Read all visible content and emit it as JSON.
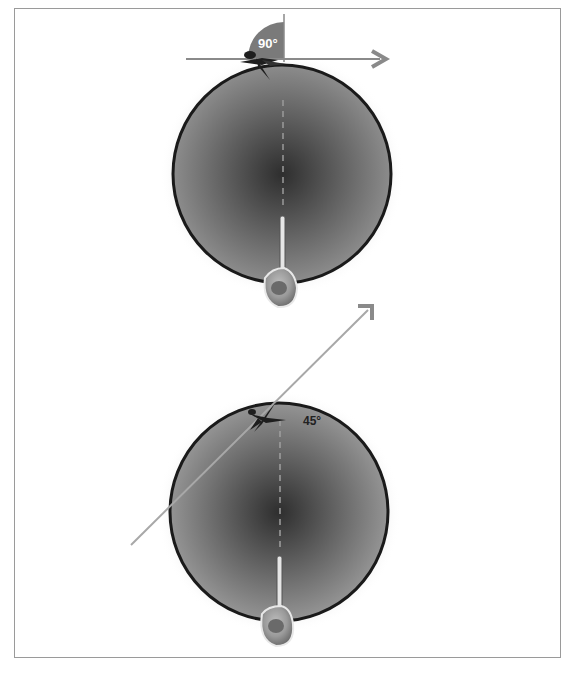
{
  "figure": {
    "panels": [
      {
        "id": "top",
        "angle_label": "90°",
        "angle_degrees": 90,
        "circle": {
          "cx": 282,
          "cy": 174,
          "r": 109
        },
        "direction_line": {
          "from": [
            186,
            59
          ],
          "to": [
            386,
            59
          ]
        },
        "wedge": {
          "cx": 284,
          "cy": 58,
          "r": 36
        }
      },
      {
        "id": "bottom",
        "angle_label": "45°",
        "angle_degrees": 45,
        "circle": {
          "cx": 279,
          "cy": 512,
          "r": 109
        },
        "direction_line": {
          "from": [
            131,
            545
          ],
          "to": [
            372,
            306
          ]
        }
      }
    ]
  },
  "colors": {
    "frame_border": "#9a9a9a",
    "circle_outline": "#1a1a1a",
    "circle_center": "#2e2e2e",
    "circle_edge": "#8c8c8c",
    "arrow_line": "#8a8a8a",
    "wedge_fill": "#7a7a7a",
    "label_top": "#ffffff",
    "label_bottom": "#222222"
  }
}
